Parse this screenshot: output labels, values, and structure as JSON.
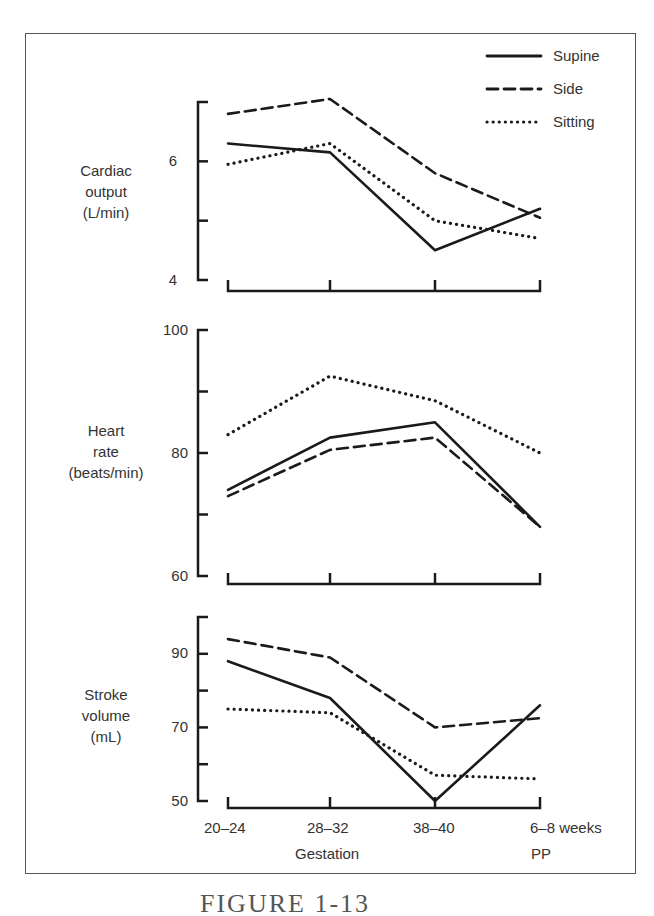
{
  "chart_data": [
    {
      "type": "line",
      "panel": "top",
      "title": "",
      "ylabel": "Cardiac output (L/min)",
      "ylabel_lines": [
        "Cardiac",
        "output",
        "(L/min)"
      ],
      "xlabel": "",
      "ylim": [
        4,
        7
      ],
      "yticks": [
        4,
        5,
        6,
        7
      ],
      "ytick_labels": [
        "4",
        "",
        "6",
        ""
      ],
      "categories": [
        "20–24",
        "28–32",
        "38–40",
        "6–8 weeks PP"
      ],
      "grid": false,
      "series": [
        {
          "name": "Supine",
          "style": "solid",
          "values": [
            6.3,
            6.15,
            4.5,
            5.2
          ]
        },
        {
          "name": "Side",
          "style": "dashed",
          "values": [
            6.8,
            7.05,
            5.8,
            5.05
          ]
        },
        {
          "name": "Sitting",
          "style": "dotted",
          "values": [
            5.95,
            6.3,
            5.0,
            4.7
          ]
        }
      ]
    },
    {
      "type": "line",
      "panel": "middle",
      "title": "",
      "ylabel": "Heart rate (beats/min)",
      "ylabel_lines": [
        "Heart",
        "rate",
        "(beats/min)"
      ],
      "xlabel": "",
      "ylim": [
        60,
        100
      ],
      "yticks": [
        60,
        70,
        80,
        90,
        100
      ],
      "ytick_labels": [
        "60",
        "",
        "80",
        "",
        "100"
      ],
      "categories": [
        "20–24",
        "28–32",
        "38–40",
        "6–8 weeks PP"
      ],
      "grid": false,
      "series": [
        {
          "name": "Supine",
          "style": "solid",
          "values": [
            74,
            82.5,
            85,
            68
          ]
        },
        {
          "name": "Side",
          "style": "dashed",
          "values": [
            73,
            80.5,
            82.5,
            68
          ]
        },
        {
          "name": "Sitting",
          "style": "dotted",
          "values": [
            83,
            92.5,
            88.5,
            80
          ]
        }
      ]
    },
    {
      "type": "line",
      "panel": "bottom",
      "title": "",
      "ylabel": "Stroke volume (mL)",
      "ylabel_lines": [
        "Stroke",
        "volume",
        "(mL)"
      ],
      "xlabel": "Gestation",
      "ylim": [
        50,
        100
      ],
      "yticks": [
        50,
        60,
        70,
        80,
        90,
        100
      ],
      "ytick_labels": [
        "50",
        "",
        "70",
        "",
        "90",
        ""
      ],
      "categories": [
        "20–24",
        "28–32",
        "38–40",
        "6–8 weeks PP"
      ],
      "grid": false,
      "series": [
        {
          "name": "Supine",
          "style": "solid",
          "values": [
            88,
            78,
            50,
            76
          ]
        },
        {
          "name": "Side",
          "style": "dashed",
          "values": [
            94,
            89,
            70,
            72.5
          ]
        },
        {
          "name": "Sitting",
          "style": "dotted",
          "values": [
            75,
            74,
            57,
            56
          ]
        }
      ]
    }
  ],
  "legend": {
    "position": "top-right",
    "items": [
      {
        "label": "Supine",
        "style": "solid"
      },
      {
        "label": "Side",
        "style": "dashed"
      },
      {
        "label": "Sitting",
        "style": "dotted"
      }
    ]
  },
  "x_axis": {
    "tick_labels": [
      "20–24",
      "28–32",
      "38–40",
      "6–8 weeks"
    ],
    "sub_labels": {
      "gestation": "Gestation",
      "pp": "PP"
    }
  },
  "caption": "FIGURE 1-13",
  "colors": {
    "line": "#1a1a1a",
    "frame": "#555555",
    "text": "#333333"
  }
}
